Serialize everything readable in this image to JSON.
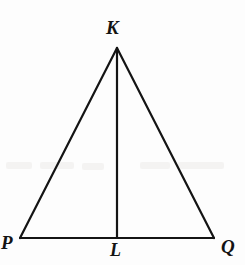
{
  "figure": {
    "kind": "geometry-diagram",
    "width": 245,
    "height": 265,
    "background_color": "#fdfdfd",
    "stroke_color": "#141414",
    "stroke_width": 2,
    "label_color": "#141414",
    "points": {
      "K": {
        "label": "K",
        "x": 117,
        "y": 48
      },
      "P": {
        "label": "P",
        "x": 20,
        "y": 238
      },
      "Q": {
        "label": "Q",
        "x": 214,
        "y": 238
      },
      "L": {
        "label": "L",
        "x": 117,
        "y": 238
      }
    },
    "segments": [
      {
        "name": "side-KP",
        "from": "K",
        "to": "P"
      },
      {
        "name": "side-KQ",
        "from": "K",
        "to": "Q"
      },
      {
        "name": "base-PQ",
        "from": "P",
        "to": "Q"
      },
      {
        "name": "altitude-KL",
        "from": "K",
        "to": "L"
      }
    ]
  }
}
